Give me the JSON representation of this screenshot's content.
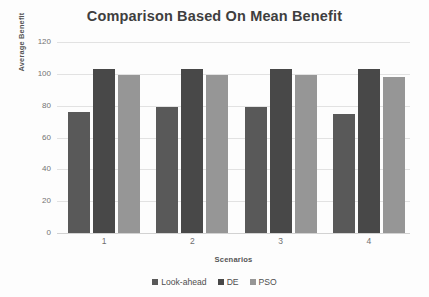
{
  "chart_data": {
    "type": "bar",
    "title": "Comparison Based On Mean Benefit",
    "xlabel": "Scenarios",
    "ylabel": "Average Benefit",
    "categories": [
      "1",
      "2",
      "3",
      "4"
    ],
    "ylim": [
      0,
      120
    ],
    "yticks": [
      0,
      20,
      40,
      60,
      80,
      100,
      120
    ],
    "grid": "horizontal",
    "legend_position": "bottom",
    "series": [
      {
        "name": "Look-ahead",
        "color": "#595959",
        "values": [
          76,
          79,
          79,
          75
        ]
      },
      {
        "name": "DE",
        "color": "#484848",
        "values": [
          103,
          103,
          103,
          103
        ]
      },
      {
        "name": "PSO",
        "color": "#969696",
        "values": [
          99,
          99,
          99,
          98
        ]
      }
    ]
  },
  "axes": {
    "y_tick_labels": [
      "120",
      "100",
      "80",
      "60",
      "40",
      "20",
      "0"
    ],
    "x_tick_labels": [
      "1",
      "2",
      "3",
      "4"
    ]
  },
  "legend": {
    "entries": [
      {
        "label": "Look-ahead",
        "swatch": "#595959"
      },
      {
        "label": "DE",
        "swatch": "#484848"
      },
      {
        "label": "PSO",
        "swatch": "#969696"
      }
    ]
  },
  "colors": {
    "background": "#fdfdfd",
    "gridline": "#e2e2e2",
    "title_text": "#3f3f3f",
    "tick_text": "#737373"
  }
}
